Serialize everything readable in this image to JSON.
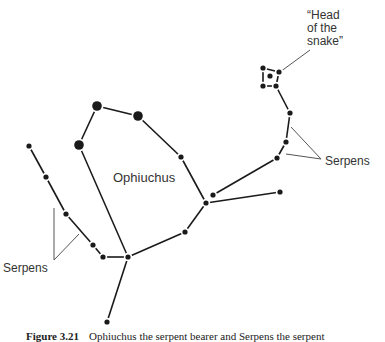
{
  "labels": {
    "constellation": "Ophiuchus",
    "serpens_right": "Serpens",
    "serpens_left": "Serpens",
    "head": "“Head\nof the\nsnake”"
  },
  "caption": {
    "number": "Figure 3.21",
    "text": "Ophiuchus the serpent bearer and Serpens the serpent"
  },
  "colors": {
    "ink": "#1a1a1a",
    "pointer": "#555555",
    "text": "#333333",
    "background": "#ffffff"
  },
  "stars": {
    "big": [
      [
        97,
        106
      ],
      [
        138,
        116
      ],
      [
        79,
        145
      ]
    ],
    "small": [
      [
        181,
        157
      ],
      [
        206,
        203
      ],
      [
        213,
        195
      ],
      [
        280,
        192
      ],
      [
        185,
        232
      ],
      [
        128,
        257
      ],
      [
        107,
        322
      ],
      [
        103,
        257
      ],
      [
        93,
        245
      ],
      [
        66,
        214
      ],
      [
        46,
        177
      ],
      [
        29,
        146
      ],
      [
        277,
        158
      ],
      [
        286,
        142
      ],
      [
        290,
        113
      ],
      [
        276,
        86
      ],
      [
        263,
        86
      ],
      [
        263,
        68
      ],
      [
        279,
        72
      ],
      [
        270,
        76
      ]
    ]
  },
  "lines": [
    [
      [
        79,
        145
      ],
      [
        97,
        106
      ]
    ],
    [
      [
        97,
        106
      ],
      [
        138,
        116
      ]
    ],
    [
      [
        138,
        116
      ],
      [
        181,
        157
      ]
    ],
    [
      [
        181,
        157
      ],
      [
        206,
        203
      ]
    ],
    [
      [
        79,
        145
      ],
      [
        128,
        257
      ]
    ],
    [
      [
        128,
        257
      ],
      [
        107,
        322
      ]
    ],
    [
      [
        128,
        257
      ],
      [
        185,
        232
      ]
    ],
    [
      [
        185,
        232
      ],
      [
        206,
        203
      ]
    ],
    [
      [
        206,
        203
      ],
      [
        280,
        192
      ]
    ],
    [
      [
        213,
        195
      ],
      [
        277,
        158
      ]
    ],
    [
      [
        128,
        257
      ],
      [
        103,
        257
      ]
    ],
    [
      [
        103,
        257
      ],
      [
        93,
        245
      ]
    ],
    [
      [
        93,
        245
      ],
      [
        66,
        214
      ]
    ],
    [
      [
        66,
        214
      ],
      [
        46,
        177
      ]
    ],
    [
      [
        46,
        177
      ],
      [
        29,
        146
      ]
    ],
    [
      [
        277,
        158
      ],
      [
        286,
        142
      ]
    ],
    [
      [
        286,
        142
      ],
      [
        290,
        113
      ]
    ],
    [
      [
        290,
        113
      ],
      [
        276,
        86
      ]
    ],
    [
      [
        276,
        86
      ],
      [
        263,
        86
      ]
    ],
    [
      [
        263,
        86
      ],
      [
        263,
        68
      ]
    ],
    [
      [
        263,
        68
      ],
      [
        279,
        72
      ]
    ],
    [
      [
        279,
        72
      ],
      [
        276,
        86
      ]
    ]
  ],
  "pointers": [
    [
      [
        280,
        72
      ],
      [
        310,
        50
      ]
    ],
    [
      [
        291,
        127
      ],
      [
        321,
        159
      ]
    ],
    [
      [
        286,
        154
      ],
      [
        321,
        159
      ]
    ],
    [
      [
        54,
        208
      ],
      [
        54,
        260
      ]
    ],
    [
      [
        54,
        260
      ],
      [
        79,
        234
      ]
    ]
  ]
}
